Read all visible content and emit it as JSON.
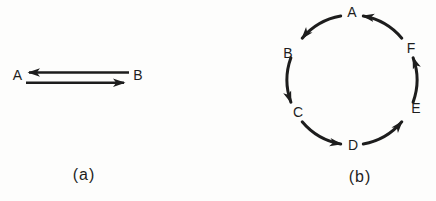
{
  "figure": {
    "background_color": "#fdfdfc",
    "ink_color": "#1d1d1d",
    "panel_a": {
      "caption": "(a)",
      "left_node": "A",
      "right_node": "B",
      "arrows": [
        {
          "from": "B",
          "to": "A",
          "position": "top"
        },
        {
          "from": "A",
          "to": "B",
          "position": "bottom"
        }
      ]
    },
    "panel_b": {
      "caption": "(b)",
      "nodes": [
        "A",
        "B",
        "C",
        "D",
        "E",
        "F"
      ],
      "edges": [
        {
          "from": "A",
          "to": "B"
        },
        {
          "from": "B",
          "to": "C"
        },
        {
          "from": "C",
          "to": "D"
        },
        {
          "from": "D",
          "to": "E"
        },
        {
          "from": "E",
          "to": "F"
        },
        {
          "from": "F",
          "to": "A"
        }
      ]
    }
  }
}
